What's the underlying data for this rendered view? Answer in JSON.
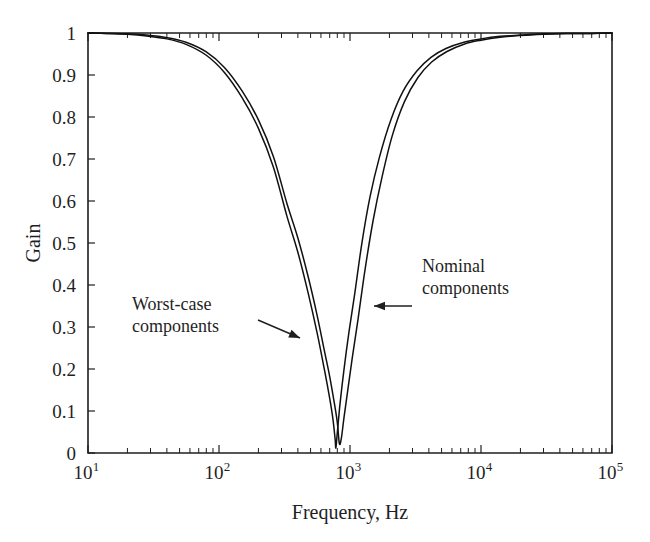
{
  "chart_data": {
    "type": "line",
    "title": "",
    "xlabel": "Frequency, Hz",
    "ylabel": "Gain",
    "xscale": "log",
    "yscale": "linear",
    "xlim": [
      10,
      100000
    ],
    "ylim": [
      0,
      1
    ],
    "grid": false,
    "legend_position": "none",
    "x_tick_labels": [
      "10",
      "10",
      "10",
      "10",
      "10"
    ],
    "x_tick_exponents": [
      "1",
      "2",
      "3",
      "4",
      "5"
    ],
    "x_tick_values": [
      10,
      100,
      1000,
      10000,
      100000
    ],
    "y_tick_labels": [
      "0",
      "0.1",
      "0.2",
      "0.3",
      "0.4",
      "0.5",
      "0.6",
      "0.7",
      "0.8",
      "0.9",
      "1"
    ],
    "y_tick_values": [
      0,
      0.1,
      0.2,
      0.3,
      0.4,
      0.5,
      0.6,
      0.7,
      0.8,
      0.9,
      1
    ],
    "series": [
      {
        "name": "Nominal components",
        "color": "#111111",
        "notch_frequency_hz": 830,
        "x": [
          10,
          14,
          20,
          28,
          40,
          56,
          80,
          110,
          150,
          200,
          260,
          330,
          400,
          480,
          560,
          640,
          700,
          760,
          800,
          830,
          860,
          900,
          960,
          1040,
          1150,
          1300,
          1500,
          1750,
          2100,
          2600,
          3300,
          4200,
          5500,
          7500,
          10000,
          14000,
          20000,
          30000,
          45000,
          70000,
          100000
        ],
        "y": [
          1.0,
          0.999,
          0.998,
          0.995,
          0.989,
          0.978,
          0.955,
          0.918,
          0.862,
          0.793,
          0.706,
          0.594,
          0.512,
          0.419,
          0.329,
          0.241,
          0.182,
          0.118,
          0.073,
          0.022,
          0.036,
          0.085,
          0.148,
          0.226,
          0.317,
          0.435,
          0.553,
          0.655,
          0.755,
          0.836,
          0.894,
          0.931,
          0.956,
          0.974,
          0.983,
          0.99,
          0.994,
          0.997,
          0.999,
          0.999,
          1.0
        ]
      },
      {
        "name": "Worst-case components",
        "color": "#111111",
        "notch_frequency_hz": 780,
        "x": [
          10,
          14,
          20,
          28,
          40,
          56,
          80,
          110,
          150,
          200,
          260,
          330,
          400,
          480,
          560,
          640,
          700,
          740,
          770,
          780,
          800,
          840,
          900,
          980,
          1090,
          1230,
          1420,
          1680,
          2050,
          2550,
          3250,
          4150,
          5400,
          7400,
          10000,
          14000,
          20000,
          30000,
          45000,
          70000,
          100000
        ],
        "y": [
          1.0,
          0.999,
          0.997,
          0.993,
          0.986,
          0.973,
          0.947,
          0.906,
          0.846,
          0.773,
          0.681,
          0.564,
          0.478,
          0.38,
          0.287,
          0.196,
          0.13,
          0.082,
          0.033,
          0.012,
          0.048,
          0.118,
          0.199,
          0.286,
          0.382,
          0.498,
          0.609,
          0.705,
          0.793,
          0.862,
          0.91,
          0.942,
          0.963,
          0.978,
          0.986,
          0.992,
          0.995,
          0.998,
          0.999,
          0.999,
          1.0
        ]
      }
    ],
    "annotations": [
      {
        "id": "worst-case",
        "line1": "Worst-case",
        "line2": "components",
        "text_x": 132,
        "text_y": 310,
        "arrow_from_x": 258,
        "arrow_from_y": 320,
        "arrow_to_x": 300,
        "arrow_to_y": 338
      },
      {
        "id": "nominal",
        "line1": "Nominal",
        "line2": "components",
        "text_x": 422,
        "text_y": 272,
        "arrow_from_x": 412,
        "arrow_from_y": 306,
        "arrow_to_x": 374,
        "arrow_to_y": 306
      }
    ]
  },
  "axes_geometry": {
    "left": 88,
    "right": 612,
    "top": 33,
    "bottom": 453
  }
}
